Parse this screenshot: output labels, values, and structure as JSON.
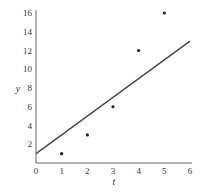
{
  "chart_data": {
    "type": "scatter",
    "title": "",
    "xlabel": "t",
    "ylabel": "y",
    "xlim": [
      0,
      6
    ],
    "ylim": [
      0,
      16
    ],
    "x_ticks": [
      "0",
      "1",
      "2",
      "3",
      "4",
      "5",
      "6"
    ],
    "y_ticks": [
      "2",
      "4",
      "6",
      "8",
      "10",
      "12",
      "14",
      "16"
    ],
    "grid": false,
    "series": [
      {
        "name": "data points",
        "type": "scatter",
        "x": [
          1,
          2,
          3,
          4,
          5
        ],
        "y": [
          1,
          3,
          6,
          12,
          16
        ]
      },
      {
        "name": "fitted line",
        "type": "line",
        "x": [
          0,
          6
        ],
        "y": [
          1,
          13
        ]
      }
    ]
  },
  "colors": {
    "axis": "#555555",
    "points": "#222222",
    "line": "#444444"
  }
}
